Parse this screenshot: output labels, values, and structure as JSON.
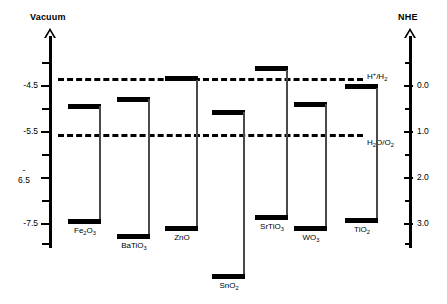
{
  "figure": {
    "type": "band-edge-diagram"
  },
  "left_axis": {
    "title": "Vacuum",
    "unit": "eV",
    "labels": [
      "-4.5",
      "-5.5",
      "-",
      "6.5",
      "-7.5"
    ],
    "ticks": [
      {
        "label": "",
        "value": -4.0
      },
      {
        "label": "-4.5",
        "value": -4.5
      },
      {
        "label": "",
        "value": -5.0
      },
      {
        "label": "-5.5",
        "value": -5.5
      },
      {
        "label": "",
        "value": -6.0
      },
      {
        "label": "-6.5",
        "value": -6.5
      },
      {
        "label": "",
        "value": -7.0
      },
      {
        "label": "-7.5",
        "value": -7.5
      },
      {
        "label": "",
        "value": -8.0
      }
    ]
  },
  "right_axis": {
    "title": "NHE",
    "unit": "V",
    "ticks": [
      {
        "label": "",
        "value": -0.5
      },
      {
        "label": "0.0",
        "value": 0.0
      },
      {
        "label": "",
        "value": 0.5
      },
      {
        "label": "1.0",
        "value": 1.0
      },
      {
        "label": "",
        "value": 1.5
      },
      {
        "label": "2.0",
        "value": 2.0
      },
      {
        "label": "",
        "value": 2.5
      },
      {
        "label": "3.0",
        "value": 3.0
      },
      {
        "label": "",
        "value": 3.5
      }
    ]
  },
  "redox_levels": [
    {
      "id": "hydrogen",
      "label_html": "H<sup>+</sup>/H<sub>2</sub>",
      "label_plain": "H+/H2",
      "nhe": 0.0,
      "vacuum": -4.5
    },
    {
      "id": "oxygen",
      "label_html": "H<sub>2</sub>O/O<sub>2</sub>",
      "label_plain": "H2O/O2",
      "nhe": 1.23,
      "vacuum": -5.73
    }
  ],
  "materials": [
    {
      "id": "fe2o3",
      "label_html": "Fe<sub>2</sub>O<sub>3</sub>",
      "label_plain": "Fe2O3",
      "cb_vacuum": -4.78,
      "vb_vacuum": -6.88,
      "bandgap": 2.1
    },
    {
      "id": "batio3",
      "label_html": "BaTiO<sub>3</sub>",
      "label_plain": "BaTiO3",
      "cb_vacuum": -4.58,
      "vb_vacuum": -7.78,
      "bandgap": 3.2
    },
    {
      "id": "zno",
      "label_html": "ZnO",
      "label_plain": "ZnO",
      "cb_vacuum": -4.48,
      "vb_vacuum": -7.68,
      "bandgap": 3.2
    },
    {
      "id": "sno2",
      "label_html": "SnO<sub>2</sub>",
      "label_plain": "SnO2",
      "cb_vacuum": -4.68,
      "vb_vacuum": -8.48,
      "bandgap": 3.8
    },
    {
      "id": "srtio3",
      "label_html": "SrTiO<sub>3</sub>",
      "label_plain": "SrTiO3",
      "cb_vacuum": -4.28,
      "vb_vacuum": -7.48,
      "bandgap": 3.2
    },
    {
      "id": "wo3",
      "label_html": "WO<sub>3</sub>",
      "label_plain": "WO3",
      "cb_vacuum": -4.78,
      "vb_vacuum": -7.58,
      "bandgap": 2.8
    },
    {
      "id": "tio2",
      "label_html": "TiO<sub>2</sub>",
      "label_plain": "TiO2",
      "cb_vacuum": -4.58,
      "vb_vacuum": -7.78,
      "bandgap": 3.2
    }
  ],
  "chart_data": {
    "type": "bar",
    "title": "",
    "xlabel": "",
    "ylabel": "Vacuum",
    "categories": [
      "Fe2O3",
      "BaTiO3",
      "ZnO",
      "SnO2",
      "SrTiO3",
      "WO3",
      "TiO2"
    ],
    "series": [
      {
        "name": "Conduction band edge (eV vs vacuum)",
        "values": [
          -4.78,
          -4.58,
          -4.48,
          -4.68,
          -4.28,
          -4.78,
          -4.58
        ]
      },
      {
        "name": "Valence band edge (eV vs vacuum)",
        "values": [
          -6.88,
          -7.78,
          -7.68,
          -8.48,
          -7.48,
          -7.58,
          -7.78
        ]
      }
    ],
    "ylim": [
      -4.0,
      -8.6
    ],
    "grid": false,
    "legend": "none",
    "annotations": [
      "H+/H2",
      "H2O/O2"
    ]
  }
}
